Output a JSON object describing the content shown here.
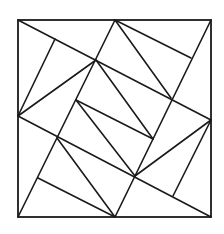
{
  "diagram": {
    "type": "geometric-dissection",
    "stroke_color": "#1a1a1a",
    "background": "#ffffff",
    "outer_square": {
      "x": 18,
      "y": 20,
      "width": 193,
      "height": 197
    },
    "points": {
      "TL": [
        18,
        20
      ],
      "TR": [
        211,
        20
      ],
      "BL": [
        18,
        217
      ],
      "BR": [
        211,
        217
      ],
      "T": [
        115,
        20
      ],
      "Bm": [
        115,
        217
      ],
      "L": [
        18,
        116
      ],
      "R": [
        211,
        120
      ],
      "B": [
        96,
        60
      ],
      "C": [
        171,
        98
      ],
      "D": [
        135,
        176
      ],
      "F": [
        57,
        138
      ],
      "A": [
        76,
        100
      ],
      "E": [
        153,
        139
      ],
      "foot_tl": [
        55,
        39
      ],
      "foot_tr": [
        191,
        58
      ],
      "foot_br": [
        173,
        196
      ],
      "foot_bl": [
        38,
        178
      ]
    },
    "segments": [
      {
        "name": "line-tl-to-r",
        "from": "TL",
        "to": "R"
      },
      {
        "name": "line-l-to-br",
        "from": "L",
        "to": "BR"
      },
      {
        "name": "line-t-to-bl",
        "from": "T",
        "to": "BL"
      },
      {
        "name": "line-tr-to-bm",
        "from": "TR",
        "to": "Bm"
      },
      {
        "name": "line-l-to-b",
        "from": "L",
        "to": "B"
      },
      {
        "name": "line-l-to-foot-tl",
        "from": "L",
        "to": "foot_tl"
      },
      {
        "name": "line-t-to-c",
        "from": "T",
        "to": "C"
      },
      {
        "name": "line-t-to-foot-tr",
        "from": "T",
        "to": "foot_tr"
      },
      {
        "name": "line-r-to-d",
        "from": "R",
        "to": "D"
      },
      {
        "name": "line-r-to-foot-br",
        "from": "R",
        "to": "foot_br"
      },
      {
        "name": "line-f-to-bm",
        "from": "F",
        "to": "Bm"
      },
      {
        "name": "line-foot-bl-to-bm",
        "from": "foot_bl",
        "to": "Bm"
      },
      {
        "name": "line-a-to-e",
        "from": "A",
        "to": "E"
      },
      {
        "name": "line-b-to-e",
        "from": "B",
        "to": "E"
      },
      {
        "name": "line-a-to-d",
        "from": "A",
        "to": "D"
      }
    ]
  }
}
